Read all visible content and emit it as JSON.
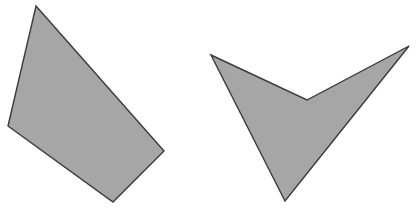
{
  "scene": {
    "width": 416,
    "height": 208,
    "background_color": "#ffffff",
    "title": "Two gray polygons on white background"
  },
  "style": {
    "fill_color": "#a6a6a6",
    "fill_color_secondary": "#a9a9a9",
    "stroke_color": "#3a3a3a",
    "stroke_width": 1.4
  },
  "shapes": [
    {
      "name": "quadrilateral",
      "vertex_count": 4,
      "convex": true,
      "fill": "#a6a6a6",
      "stroke": "#3a3a3a",
      "points": "36,6 164,151 113,202 8,126",
      "vertices": [
        {
          "label": "top",
          "x": 36,
          "y": 6
        },
        {
          "label": "right",
          "x": 164,
          "y": 151
        },
        {
          "label": "bottom",
          "x": 113,
          "y": 202
        },
        {
          "label": "left",
          "x": 8,
          "y": 126
        }
      ]
    },
    {
      "name": "chevron-arrowhead",
      "vertex_count": 4,
      "convex": false,
      "fill": "#a6a6a6",
      "stroke": "#3a3a3a",
      "points": "211,55 307,100 409,46 285,201",
      "vertices": [
        {
          "label": "left-tip",
          "x": 211,
          "y": 55
        },
        {
          "label": "inner-notch",
          "x": 307,
          "y": 100
        },
        {
          "label": "right-tip",
          "x": 409,
          "y": 46
        },
        {
          "label": "bottom-point",
          "x": 285,
          "y": 201
        }
      ]
    }
  ]
}
